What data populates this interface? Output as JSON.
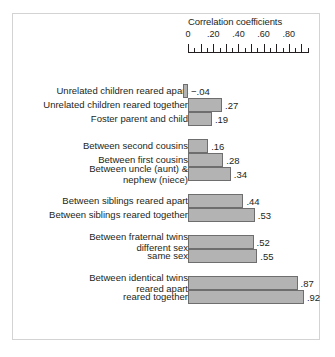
{
  "chart_data": {
    "type": "bar",
    "orientation": "horizontal",
    "title": "Correlation coefficients",
    "xlabel": "",
    "ylabel": "",
    "xlim": [
      -0.05,
      1.0
    ],
    "grid": false,
    "legend": null,
    "tick_labels": [
      "0",
      ".20",
      ".40",
      ".60",
      ".80"
    ],
    "tick_values": [
      0,
      0.2,
      0.4,
      0.6,
      0.8
    ],
    "minor_tick_step": 0.05,
    "categories": [
      "Unrelated children reared apart",
      "Unrelated children reared together",
      "Foster parent and child",
      "Between second cousins",
      "Between first cousins",
      "Between uncle (aunt) & nephew (niece)",
      "Between siblings reared apart",
      "Between siblings reared together",
      "Between fraternal twins different sex",
      "same sex",
      "Between identical twins reared apart",
      "reared together"
    ],
    "values": [
      -0.04,
      0.27,
      0.19,
      0.16,
      0.28,
      0.34,
      0.44,
      0.53,
      0.52,
      0.55,
      0.87,
      0.92
    ],
    "value_labels": [
      "−.04",
      ".27",
      ".19",
      ".16",
      ".28",
      ".34",
      ".44",
      ".53",
      ".52",
      ".55",
      ".87",
      ".92"
    ],
    "bar_color": "#b3b3b3",
    "bar_border_color": "#6e6e6e",
    "groups": [
      {
        "rows": [
          {
            "label_lines": [
              "Unrelated children reared apart"
            ],
            "value": -0.04,
            "value_label": "−.04"
          },
          {
            "label_lines": [
              "Unrelated children reared together"
            ],
            "value": 0.27,
            "value_label": ".27"
          },
          {
            "label_lines": [
              "Foster parent and child"
            ],
            "value": 0.19,
            "value_label": ".19"
          }
        ]
      },
      {
        "rows": [
          {
            "label_lines": [
              "Between second cousins"
            ],
            "value": 0.16,
            "value_label": ".16"
          },
          {
            "label_lines": [
              "Between first cousins"
            ],
            "value": 0.28,
            "value_label": ".28"
          },
          {
            "label_lines": [
              "Between uncle (aunt) &",
              "nephew (niece)"
            ],
            "value": 0.34,
            "value_label": ".34"
          }
        ]
      },
      {
        "rows": [
          {
            "label_lines": [
              "Between siblings reared apart"
            ],
            "value": 0.44,
            "value_label": ".44"
          },
          {
            "label_lines": [
              "Between siblings reared together"
            ],
            "value": 0.53,
            "value_label": ".53"
          }
        ]
      },
      {
        "rows": [
          {
            "label_lines": [
              "Between fraternal twins",
              "different sex"
            ],
            "value": 0.52,
            "value_label": ".52"
          },
          {
            "label_lines": [
              "same sex"
            ],
            "value": 0.55,
            "value_label": ".55"
          }
        ]
      },
      {
        "rows": [
          {
            "label_lines": [
              "Between identical twins",
              "reared apart"
            ],
            "value": 0.87,
            "value_label": ".87"
          },
          {
            "label_lines": [
              "reared together"
            ],
            "value": 0.92,
            "value_label": ".92"
          }
        ]
      }
    ]
  }
}
